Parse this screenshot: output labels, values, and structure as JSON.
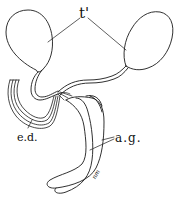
{
  "figure": {
    "type": "anatomical line drawing",
    "labels": {
      "testes": "t'",
      "ejaculatory_duct": "e.d.",
      "accessory_glands": "a.g.",
      "signature": "nm"
    },
    "colors": {
      "background": "#ffffff",
      "ink": "#1a1a1a"
    }
  }
}
